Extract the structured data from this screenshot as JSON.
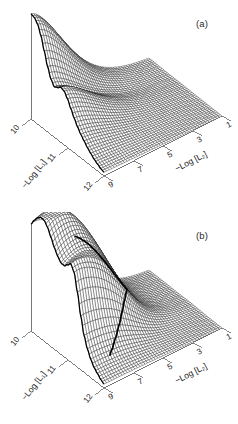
{
  "figure": {
    "background_color": "#ffffff",
    "ink_color": "#1a1a1a",
    "axis_color": "#555555",
    "highlight_color": "#000000",
    "width": 238,
    "height": 424
  },
  "panels": [
    {
      "id": "a",
      "label": "(a)",
      "axes": {
        "left": {
          "title": "−Log [L₁]",
          "ticks": [
            "10",
            "11",
            "12"
          ],
          "values": [
            10,
            11,
            12
          ]
        },
        "right": {
          "title": "−Log [L₂]",
          "ticks": [
            "9",
            "7",
            "5",
            "3",
            "1"
          ],
          "values": [
            9,
            7,
            5,
            3,
            1
          ]
        }
      },
      "surface": {
        "description": "smooth monotonic ramp with a single tall ridge along the rear-left edge falling steeply to a broad low plateau",
        "has_highlight_curve": false,
        "ridge_profile": [
          1.0,
          0.99,
          0.95,
          0.86,
          0.73,
          0.6,
          0.5,
          0.45,
          0.47,
          0.5,
          0.49,
          0.44,
          0.37,
          0.3,
          0.24,
          0.19,
          0.15,
          0.11,
          0.08,
          0.05,
          0.03,
          0.01,
          0.0
        ]
      }
    },
    {
      "id": "b",
      "label": "(b)",
      "axes": {
        "left": {
          "title": "−Log [L₁]",
          "ticks": [
            "10",
            "11",
            "12"
          ],
          "values": [
            10,
            11,
            12
          ]
        },
        "right": {
          "title": "−Log [L₂]",
          "ticks": [
            "9",
            "7",
            "5",
            "3",
            "1"
          ],
          "values": [
            9,
            7,
            5,
            3,
            1
          ]
        }
      },
      "surface": {
        "description": "ramp with a broad saddle ridge and a steep fold; a dark contour curve traces the fold diagonally across the surface",
        "has_highlight_curve": true,
        "ridge_profile": [
          0.86,
          0.9,
          0.93,
          0.95,
          0.94,
          0.9,
          0.84,
          0.78,
          0.74,
          0.72,
          0.74,
          0.8,
          0.86,
          0.82,
          0.66,
          0.46,
          0.3,
          0.2,
          0.13,
          0.08,
          0.05,
          0.02,
          0.0
        ]
      }
    }
  ],
  "chart_data": {
    "type": "line",
    "title": "",
    "xlabel": "−Log [L₂]",
    "ylabel": "−Log [L₁]",
    "zlabel": "",
    "xlim": [
      9,
      1
    ],
    "ylim": [
      10,
      12
    ],
    "grid": true,
    "legend": null,
    "projection": "3d-wireframe",
    "xticks": [
      9,
      7,
      5,
      3,
      1
    ],
    "yticks": [
      10,
      11,
      12
    ],
    "series": [
      {
        "name": "(a) surface ridge height vs −Log [L₁]",
        "x": [
          10.0,
          10.09,
          10.18,
          10.27,
          10.36,
          10.45,
          10.55,
          10.64,
          10.73,
          10.82,
          10.91,
          11.0,
          11.09,
          11.18,
          11.27,
          11.36,
          11.45,
          11.55,
          11.64,
          11.73,
          11.82,
          11.91,
          12.0
        ],
        "values": [
          1.0,
          0.99,
          0.95,
          0.86,
          0.73,
          0.6,
          0.5,
          0.45,
          0.47,
          0.5,
          0.49,
          0.44,
          0.37,
          0.3,
          0.24,
          0.19,
          0.15,
          0.11,
          0.08,
          0.05,
          0.03,
          0.01,
          0.0
        ]
      },
      {
        "name": "(b) surface ridge height vs −Log [L₁]",
        "x": [
          10.0,
          10.09,
          10.18,
          10.27,
          10.36,
          10.45,
          10.55,
          10.64,
          10.73,
          10.82,
          10.91,
          11.0,
          11.09,
          11.18,
          11.27,
          11.36,
          11.45,
          11.55,
          11.64,
          11.73,
          11.82,
          11.91,
          12.0
        ],
        "values": [
          0.86,
          0.9,
          0.93,
          0.95,
          0.94,
          0.9,
          0.84,
          0.78,
          0.74,
          0.72,
          0.74,
          0.8,
          0.86,
          0.82,
          0.66,
          0.46,
          0.3,
          0.2,
          0.13,
          0.08,
          0.05,
          0.02,
          0.0
        ]
      }
    ]
  }
}
